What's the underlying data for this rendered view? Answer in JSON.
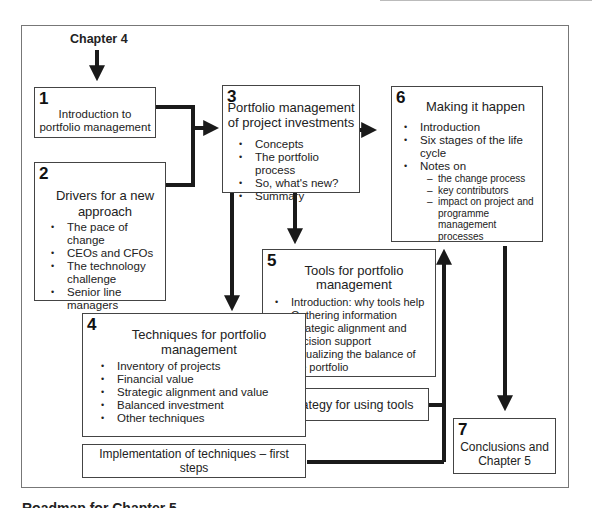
{
  "figure": {
    "start_label": "Chapter 4",
    "bottom_caption": "Roadmap for Chapter 5"
  },
  "boxes": {
    "b1": {
      "number": "1",
      "title": "Introduction to portfolio management"
    },
    "b2": {
      "number": "2",
      "title": "Drivers for a new approach",
      "items": [
        "The pace of change",
        "CEOs and CFOs",
        "The technology challenge",
        "Senior line managers"
      ]
    },
    "b3": {
      "number": "3",
      "title": "Portfolio management of project investments",
      "items": [
        "Concepts",
        "The portfolio process",
        "So, what's new?",
        "Summary"
      ]
    },
    "b4": {
      "number": "4",
      "title": "Techniques for portfolio management",
      "items": [
        "Inventory of projects",
        "Financial value",
        "Strategic alignment and value",
        "Balanced investment",
        "Other techniques"
      ]
    },
    "b4a": {
      "title": "Implementation of techniques – first steps"
    },
    "b5": {
      "number": "5",
      "title": "Tools for portfolio management",
      "items": [
        "Introduction: why tools help",
        "Gathering information",
        "Strategic alignment and decision support",
        "Visualizing the balance of the portfolio"
      ]
    },
    "b5a": {
      "title": "A strategy for using tools"
    },
    "b6": {
      "number": "6",
      "title": "Making it happen",
      "items": [
        "Introduction",
        "Six stages of the life cycle",
        "Notes on"
      ],
      "subitems": [
        "the change process",
        "key contributors",
        "impact on project and programme management processes"
      ]
    },
    "b7": {
      "number": "7",
      "title": "Conclusions and Chapter 5"
    }
  },
  "colors": {
    "line": "#1a1a1a",
    "box_border": "#444444",
    "frame": "#777777"
  }
}
